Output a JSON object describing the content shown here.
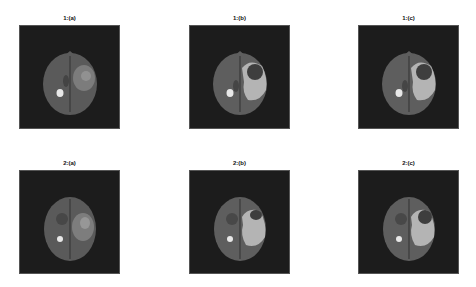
{
  "figure": {
    "panels": [
      {
        "id": "1a",
        "title": "1:(a)",
        "kind": "original-mri"
      },
      {
        "id": "1b",
        "title": "1:(b)",
        "kind": "segmented"
      },
      {
        "id": "1c",
        "title": "1:(c)",
        "kind": "segmented"
      },
      {
        "id": "2a",
        "title": "2:(a)",
        "kind": "original-mri"
      },
      {
        "id": "2b",
        "title": "2:(b)",
        "kind": "segmented"
      },
      {
        "id": "2c",
        "title": "2:(c)",
        "kind": "segmented"
      }
    ],
    "colors": {
      "background": "#1c1c1c",
      "brain": "#5e5e5e",
      "brain_dark": "#3a3a3a",
      "lesion_bright": "#e8e8e8",
      "tumor_region": "#b4b4b4",
      "tumor_core": "#3e3e3e",
      "edema": "#8a8a8a"
    }
  }
}
